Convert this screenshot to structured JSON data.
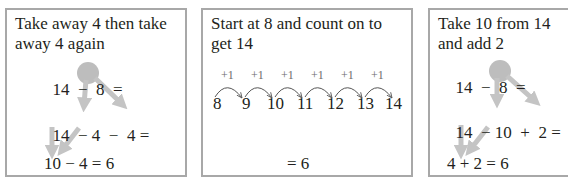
{
  "panels": [
    {
      "title_line1": "Take away 4 then take",
      "title_line2": "away 4 again",
      "row1": [
        "14",
        "−",
        "8",
        "="
      ],
      "row2": [
        "14",
        "−",
        "4",
        "−",
        "4",
        "="
      ],
      "row3": "10 − 4 = 6"
    },
    {
      "title_line1": "Start at 8 and count on to",
      "title_line2": "get 14",
      "steps": [
        "+1",
        "+1",
        "+1",
        "+1",
        "+1",
        "+1"
      ],
      "numbers": [
        "8",
        "9",
        "10",
        "11",
        "12",
        "13",
        "14"
      ],
      "result": "= 6"
    },
    {
      "title_line1": "Take 10 from 14",
      "title_line2": "and add 2",
      "row1": [
        "14",
        "−",
        "8",
        "="
      ],
      "row2": [
        "14",
        "−",
        "10",
        "+",
        "2",
        "="
      ],
      "row3": "4 + 2 = 6"
    }
  ],
  "colors": {
    "border": "#a8a8a8",
    "highlight": "#bdbdbd",
    "arrow": "#c4c4c4",
    "text": "#231f20"
  }
}
